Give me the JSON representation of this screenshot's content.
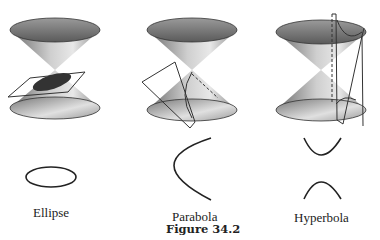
{
  "figure": {
    "caption": "Figure 34.2",
    "panels": [
      {
        "label": "Ellipse"
      },
      {
        "label": "Parabola"
      },
      {
        "label": "Hyperbola"
      }
    ]
  }
}
